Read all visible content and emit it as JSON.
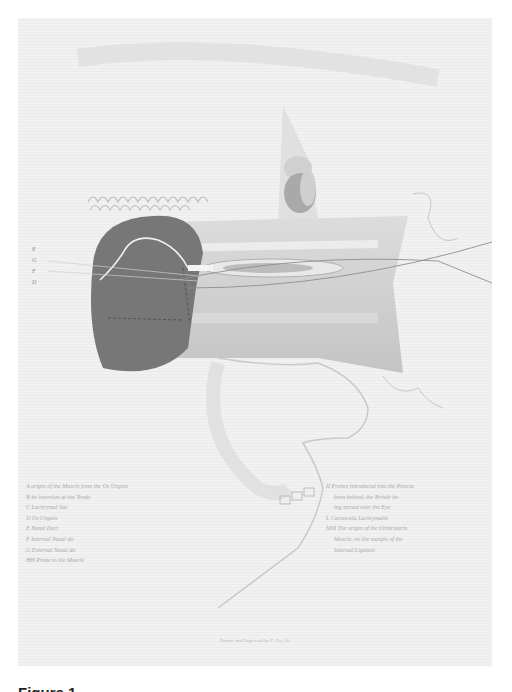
{
  "plate": {
    "side_letters": [
      "E",
      "G",
      "F",
      "D"
    ],
    "legend_left": [
      "A origin of the Muscle from the Os Unguis",
      "B its insertion at the Tendo",
      "C Lachrymal Sac",
      "D Os Unguis",
      "E Nasal Duct",
      "F Internal Nasal do",
      "G External Nasal do",
      "HH Probe in the Muscle"
    ],
    "legend_right": [
      {
        "text": "II Probes introduced into the Puncta",
        "indent": false
      },
      {
        "text": "from behind, the Bristle be-",
        "indent": true
      },
      {
        "text": "ing turned over the Eye",
        "indent": true
      },
      {
        "text": "L Caruncula Lachrymalis",
        "indent": false
      },
      {
        "text": "MM The origin of the Orbicularis",
        "indent": false
      },
      {
        "text": "Muscle, on the margin of the",
        "indent": true
      },
      {
        "text": "Internal Ligature",
        "indent": true
      }
    ],
    "credit": "Drawn and Engraved by T. Fry, Sc."
  },
  "figure_caption": "Figure 1"
}
